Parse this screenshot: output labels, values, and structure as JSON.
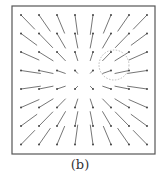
{
  "figure": {
    "caption": "(b)",
    "type": "vector-field",
    "frame": {
      "x": 12,
      "y": 6,
      "width": 143,
      "height": 148,
      "stroke": "#555555"
    },
    "grid": {
      "cols": 8,
      "rows": 8,
      "x0": 21,
      "y0": 15,
      "dx": 18,
      "dy": 18.5
    },
    "center": {
      "x": 84,
      "y": 80
    },
    "arrow_color": "#666666",
    "highlight_circle": {
      "cx": 114,
      "cy": 65,
      "r": 15,
      "stroke": "#bbbbbb",
      "style": "dotted"
    }
  }
}
